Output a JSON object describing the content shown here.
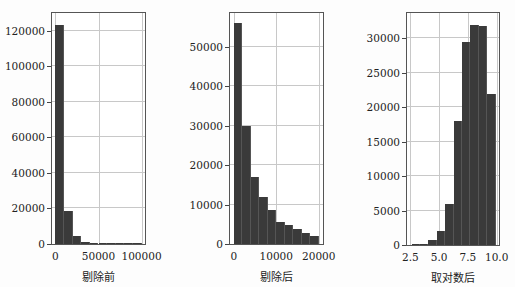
{
  "chart_data": [
    {
      "type": "bar",
      "subtype": "histogram",
      "title": "",
      "xlabel": "剔除前",
      "ylabel": "",
      "xlim": [
        -4000,
        104000
      ],
      "ylim": [
        0,
        130000
      ],
      "grid": true,
      "yticks": [
        0,
        20000,
        40000,
        60000,
        80000,
        100000,
        120000
      ],
      "xticks": [
        0,
        50000,
        100000
      ],
      "bin_edges": [
        0,
        10000,
        20000,
        30000,
        40000,
        50000,
        60000,
        70000,
        80000,
        90000,
        100000
      ],
      "values": [
        123500,
        18500,
        4700,
        1300,
        500,
        300,
        150,
        60,
        30,
        20
      ]
    },
    {
      "type": "bar",
      "subtype": "histogram",
      "title": "",
      "xlabel": "剔除后",
      "ylabel": "",
      "xlim": [
        -900,
        21000
      ],
      "ylim": [
        0,
        58500
      ],
      "grid": true,
      "yticks": [
        0,
        10000,
        20000,
        30000,
        40000,
        50000
      ],
      "xticks": [
        0,
        10000,
        20000
      ],
      "bin_edges": [
        0,
        2000,
        4000,
        6000,
        8000,
        10000,
        12000,
        14000,
        16000,
        18000,
        20000
      ],
      "values": [
        56000,
        30000,
        17000,
        12000,
        8700,
        5700,
        4700,
        3700,
        2700,
        2000
      ]
    },
    {
      "type": "bar",
      "subtype": "histogram",
      "title": "",
      "xlabel": "取对数后",
      "ylabel": "",
      "xlim": [
        2.2,
        10.2
      ],
      "ylim": [
        0,
        33700
      ],
      "grid": true,
      "yticks": [
        0,
        5000,
        10000,
        15000,
        20000,
        25000,
        30000
      ],
      "xticks": [
        2.5,
        5.0,
        7.5,
        10.0
      ],
      "bin_edges": [
        2.6,
        3.33,
        4.06,
        4.79,
        5.52,
        6.25,
        6.98,
        7.71,
        8.44,
        9.17,
        9.9
      ],
      "values": [
        50,
        100,
        800,
        2100,
        6000,
        18000,
        29500,
        32000,
        31800,
        22000
      ]
    }
  ],
  "labels": {
    "plot1": {
      "xlabel": "剔除前",
      "yticks": [
        "0",
        "20000",
        "40000",
        "60000",
        "80000",
        "100000",
        "120000"
      ],
      "xticks": [
        "0",
        "50000",
        "100000"
      ]
    },
    "plot2": {
      "xlabel": "剔除后",
      "yticks": [
        "0",
        "10000",
        "20000",
        "30000",
        "40000",
        "50000"
      ],
      "xticks": [
        "0",
        "10000",
        "20000"
      ]
    },
    "plot3": {
      "xlabel": "取对数后",
      "yticks": [
        "0",
        "5000",
        "10000",
        "15000",
        "20000",
        "25000",
        "30000"
      ],
      "xticks": [
        "2.5",
        "5.0",
        "7.5",
        "10.0"
      ]
    }
  },
  "colors": {
    "bar": "#3a3a3a",
    "grid": "#c8c8c8",
    "axis": "#555555"
  }
}
